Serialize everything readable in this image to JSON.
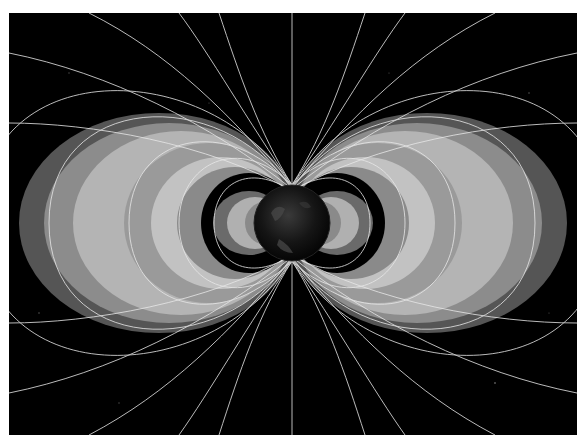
{
  "image": {
    "subject": "Earth radiation belts with magnetic dipole field lines",
    "background_color": "#000000",
    "border_color": "#ffffff",
    "belt_color": "#a8a8a8",
    "field_line_color": "#e6e6e6"
  }
}
